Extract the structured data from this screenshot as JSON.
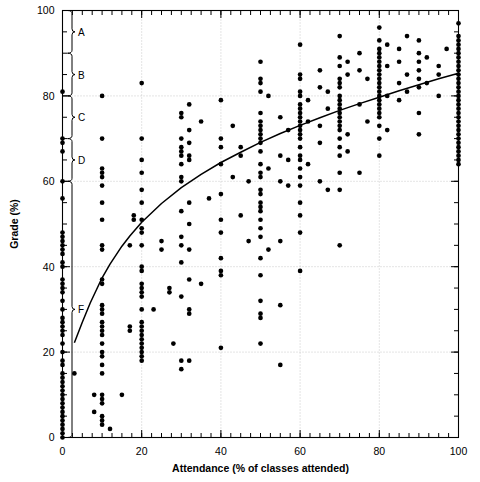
{
  "chart_data": {
    "type": "scatter",
    "title": "",
    "xlabel": "Attendance (% of classes attended)",
    "ylabel": "Grade (%)",
    "xlim": [
      0,
      100
    ],
    "ylim": [
      0,
      100
    ],
    "xticks": [
      0,
      20,
      40,
      60,
      80,
      100
    ],
    "yticks": [
      0,
      20,
      40,
      60,
      80,
      100
    ],
    "xtick_labels": [
      "0",
      "20",
      "40",
      "60",
      "80",
      "100"
    ],
    "ytick_labels": [
      "0",
      "20",
      "40",
      "60",
      "80",
      "100"
    ],
    "x_minor_tick_step": 2.5,
    "y_minor_tick_step": 5,
    "grid": "dotted-both-major",
    "legend": "none",
    "marker": "filled-circle-black",
    "grade_brackets": [
      {
        "label": "A",
        "ymin": 90,
        "ymax": 100
      },
      {
        "label": "B",
        "ymin": 80,
        "ymax": 90
      },
      {
        "label": "C",
        "ymin": 70,
        "ymax": 80
      },
      {
        "label": "D",
        "ymin": 60,
        "ymax": 70
      },
      {
        "label": "F",
        "ymin": 0,
        "ymax": 60
      }
    ],
    "fit_curve": {
      "name": "logarithmic-fit",
      "description": "monotone increasing concave curve",
      "points": [
        [
          3,
          22.2
        ],
        [
          5,
          27.0
        ],
        [
          7,
          31.5
        ],
        [
          10,
          37.4
        ],
        [
          12,
          40.6
        ],
        [
          15,
          44.8
        ],
        [
          17,
          47.2
        ],
        [
          20,
          50.4
        ],
        [
          25,
          54.8
        ],
        [
          30,
          58.5
        ],
        [
          35,
          61.6
        ],
        [
          40,
          64.4
        ],
        [
          45,
          66.8
        ],
        [
          50,
          69.1
        ],
        [
          55,
          71.2
        ],
        [
          60,
          73.1
        ],
        [
          65,
          74.9
        ],
        [
          70,
          76.6
        ],
        [
          75,
          78.2
        ],
        [
          80,
          79.7
        ],
        [
          85,
          81.2
        ],
        [
          90,
          82.6
        ],
        [
          95,
          84.0
        ],
        [
          100,
          85.3
        ]
      ]
    },
    "points": [
      [
        0,
        81
      ],
      [
        0,
        70
      ],
      [
        0,
        69
      ],
      [
        0,
        67
      ],
      [
        0,
        60
      ],
      [
        0,
        56
      ],
      [
        0,
        48
      ],
      [
        0,
        47
      ],
      [
        0,
        45
      ],
      [
        0,
        44
      ],
      [
        0,
        41
      ],
      [
        0,
        40
      ],
      [
        0,
        37
      ],
      [
        0,
        36
      ],
      [
        0,
        35
      ],
      [
        0,
        32
      ],
      [
        0,
        28
      ],
      [
        0,
        27
      ],
      [
        0,
        26
      ],
      [
        0,
        25
      ],
      [
        0,
        24
      ],
      [
        0,
        20
      ],
      [
        0,
        18
      ],
      [
        0,
        17
      ],
      [
        0,
        15
      ],
      [
        0,
        14
      ],
      [
        0,
        13
      ],
      [
        0,
        11
      ],
      [
        0,
        10
      ],
      [
        0,
        9
      ],
      [
        0,
        8
      ],
      [
        0,
        7
      ],
      [
        0,
        6
      ],
      [
        0,
        5
      ],
      [
        0,
        4
      ],
      [
        0,
        3
      ],
      [
        0,
        2
      ],
      [
        0,
        1
      ],
      [
        0,
        0
      ],
      [
        0,
        12
      ],
      [
        0,
        22
      ],
      [
        0,
        30
      ],
      [
        0,
        34
      ],
      [
        0,
        43
      ],
      [
        0,
        46
      ],
      [
        3,
        15
      ],
      [
        8,
        10
      ],
      [
        8,
        6
      ],
      [
        10,
        80
      ],
      [
        10,
        70
      ],
      [
        10,
        63
      ],
      [
        10,
        62
      ],
      [
        10,
        61
      ],
      [
        10,
        59
      ],
      [
        10,
        55
      ],
      [
        10,
        51
      ],
      [
        10,
        45
      ],
      [
        10,
        44
      ],
      [
        10,
        37
      ],
      [
        10,
        36
      ],
      [
        10,
        31
      ],
      [
        10,
        30
      ],
      [
        10,
        29
      ],
      [
        10,
        27
      ],
      [
        10,
        26
      ],
      [
        10,
        25
      ],
      [
        10,
        24
      ],
      [
        10,
        22
      ],
      [
        10,
        20
      ],
      [
        10,
        19
      ],
      [
        10,
        17
      ],
      [
        10,
        15
      ],
      [
        10,
        10
      ],
      [
        10,
        9
      ],
      [
        10,
        8
      ],
      [
        10,
        5
      ],
      [
        10,
        4
      ],
      [
        10,
        3
      ],
      [
        12,
        2
      ],
      [
        15,
        10
      ],
      [
        17,
        26
      ],
      [
        17,
        25
      ],
      [
        17,
        45
      ],
      [
        18,
        52
      ],
      [
        18,
        51
      ],
      [
        20,
        83
      ],
      [
        20,
        70
      ],
      [
        20,
        65
      ],
      [
        20,
        62
      ],
      [
        20,
        58
      ],
      [
        20,
        55
      ],
      [
        20,
        51
      ],
      [
        20,
        49
      ],
      [
        20,
        48
      ],
      [
        20,
        45
      ],
      [
        20,
        40
      ],
      [
        20,
        39
      ],
      [
        20,
        36
      ],
      [
        20,
        35
      ],
      [
        20,
        34
      ],
      [
        20,
        33
      ],
      [
        20,
        30
      ],
      [
        20,
        27
      ],
      [
        20,
        26
      ],
      [
        20,
        25
      ],
      [
        20,
        24
      ],
      [
        20,
        23
      ],
      [
        20,
        22
      ],
      [
        20,
        21
      ],
      [
        20,
        20
      ],
      [
        20,
        19
      ],
      [
        20,
        18
      ],
      [
        23,
        30
      ],
      [
        25,
        46
      ],
      [
        25,
        44
      ],
      [
        27,
        35
      ],
      [
        27,
        34
      ],
      [
        28,
        22
      ],
      [
        30,
        76
      ],
      [
        30,
        75
      ],
      [
        30,
        70
      ],
      [
        30,
        68
      ],
      [
        30,
        67
      ],
      [
        30,
        61
      ],
      [
        30,
        60
      ],
      [
        30,
        53
      ],
      [
        30,
        47
      ],
      [
        30,
        45
      ],
      [
        30,
        41
      ],
      [
        30,
        33
      ],
      [
        30,
        18
      ],
      [
        30,
        16
      ],
      [
        30,
        66
      ],
      [
        30,
        64
      ],
      [
        32,
        78
      ],
      [
        32,
        72
      ],
      [
        32,
        69
      ],
      [
        32,
        66
      ],
      [
        32,
        65
      ],
      [
        32,
        55
      ],
      [
        32,
        50
      ],
      [
        32,
        44
      ],
      [
        32,
        37
      ],
      [
        32,
        30
      ],
      [
        32,
        29
      ],
      [
        32,
        18
      ],
      [
        35,
        74
      ],
      [
        35,
        36
      ],
      [
        37,
        56
      ],
      [
        40,
        79
      ],
      [
        40,
        70
      ],
      [
        40,
        68
      ],
      [
        40,
        64
      ],
      [
        40,
        57
      ],
      [
        40,
        51
      ],
      [
        40,
        48
      ],
      [
        40,
        42
      ],
      [
        40,
        39
      ],
      [
        40,
        38
      ],
      [
        40,
        21
      ],
      [
        43,
        73
      ],
      [
        43,
        61
      ],
      [
        45,
        68
      ],
      [
        45,
        66
      ],
      [
        45,
        52
      ],
      [
        47,
        60
      ],
      [
        47,
        46
      ],
      [
        50,
        88
      ],
      [
        50,
        84
      ],
      [
        50,
        83
      ],
      [
        50,
        81
      ],
      [
        50,
        76
      ],
      [
        50,
        74
      ],
      [
        50,
        73
      ],
      [
        50,
        72
      ],
      [
        50,
        71
      ],
      [
        50,
        70
      ],
      [
        50,
        69
      ],
      [
        50,
        67
      ],
      [
        50,
        64
      ],
      [
        50,
        62
      ],
      [
        50,
        61
      ],
      [
        50,
        58
      ],
      [
        50,
        57
      ],
      [
        50,
        55
      ],
      [
        50,
        54
      ],
      [
        50,
        53
      ],
      [
        50,
        51
      ],
      [
        50,
        49
      ],
      [
        50,
        47
      ],
      [
        50,
        42
      ],
      [
        50,
        38
      ],
      [
        50,
        32
      ],
      [
        50,
        29
      ],
      [
        50,
        28
      ],
      [
        50,
        22
      ],
      [
        52,
        80
      ],
      [
        52,
        63
      ],
      [
        52,
        44
      ],
      [
        55,
        75
      ],
      [
        55,
        66
      ],
      [
        55,
        60
      ],
      [
        55,
        46
      ],
      [
        55,
        31
      ],
      [
        55,
        17
      ],
      [
        57,
        72
      ],
      [
        57,
        65
      ],
      [
        57,
        59
      ],
      [
        60,
        92
      ],
      [
        60,
        85
      ],
      [
        60,
        84
      ],
      [
        60,
        81
      ],
      [
        60,
        80
      ],
      [
        60,
        78
      ],
      [
        60,
        77
      ],
      [
        60,
        76
      ],
      [
        60,
        75
      ],
      [
        60,
        74
      ],
      [
        60,
        73
      ],
      [
        60,
        72
      ],
      [
        60,
        71
      ],
      [
        60,
        70
      ],
      [
        60,
        68
      ],
      [
        60,
        66
      ],
      [
        60,
        65
      ],
      [
        60,
        63
      ],
      [
        60,
        61
      ],
      [
        60,
        59
      ],
      [
        60,
        55
      ],
      [
        60,
        52
      ],
      [
        60,
        48
      ],
      [
        60,
        39
      ],
      [
        62,
        79
      ],
      [
        62,
        74
      ],
      [
        62,
        64
      ],
      [
        65,
        86
      ],
      [
        65,
        82
      ],
      [
        65,
        73
      ],
      [
        65,
        69
      ],
      [
        65,
        60
      ],
      [
        67,
        81
      ],
      [
        67,
        77
      ],
      [
        67,
        58
      ],
      [
        70,
        94
      ],
      [
        70,
        89
      ],
      [
        70,
        87
      ],
      [
        70,
        84
      ],
      [
        70,
        83
      ],
      [
        70,
        82
      ],
      [
        70,
        80
      ],
      [
        70,
        79
      ],
      [
        70,
        78
      ],
      [
        70,
        77
      ],
      [
        70,
        76
      ],
      [
        70,
        75
      ],
      [
        70,
        74
      ],
      [
        70,
        73
      ],
      [
        70,
        72
      ],
      [
        70,
        70
      ],
      [
        70,
        68
      ],
      [
        70,
        66
      ],
      [
        70,
        62
      ],
      [
        70,
        58
      ],
      [
        70,
        45
      ],
      [
        72,
        88
      ],
      [
        72,
        85
      ],
      [
        72,
        71
      ],
      [
        72,
        67
      ],
      [
        75,
        90
      ],
      [
        75,
        86
      ],
      [
        75,
        78
      ],
      [
        75,
        62
      ],
      [
        77,
        84
      ],
      [
        77,
        74
      ],
      [
        80,
        96
      ],
      [
        80,
        93
      ],
      [
        80,
        91
      ],
      [
        80,
        90
      ],
      [
        80,
        89
      ],
      [
        80,
        88
      ],
      [
        80,
        87
      ],
      [
        80,
        86
      ],
      [
        80,
        85
      ],
      [
        80,
        84
      ],
      [
        80,
        83
      ],
      [
        80,
        82
      ],
      [
        80,
        81
      ],
      [
        80,
        80
      ],
      [
        80,
        79
      ],
      [
        80,
        78
      ],
      [
        80,
        77
      ],
      [
        80,
        76
      ],
      [
        80,
        75
      ],
      [
        80,
        73
      ],
      [
        80,
        70
      ],
      [
        80,
        66
      ],
      [
        82,
        92
      ],
      [
        82,
        87
      ],
      [
        82,
        80
      ],
      [
        82,
        72
      ],
      [
        85,
        91
      ],
      [
        85,
        88
      ],
      [
        85,
        83
      ],
      [
        85,
        79
      ],
      [
        87,
        94
      ],
      [
        87,
        85
      ],
      [
        87,
        81
      ],
      [
        90,
        93
      ],
      [
        90,
        90
      ],
      [
        90,
        88
      ],
      [
        90,
        86
      ],
      [
        90,
        84
      ],
      [
        90,
        82
      ],
      [
        90,
        76
      ],
      [
        90,
        71
      ],
      [
        92,
        89
      ],
      [
        92,
        83
      ],
      [
        95,
        87
      ],
      [
        95,
        85
      ],
      [
        95,
        80
      ],
      [
        97,
        91
      ],
      [
        100,
        97
      ],
      [
        100,
        94
      ],
      [
        100,
        93
      ],
      [
        100,
        92
      ],
      [
        100,
        91
      ],
      [
        100,
        90
      ],
      [
        100,
        89
      ],
      [
        100,
        88
      ],
      [
        100,
        87
      ],
      [
        100,
        86
      ],
      [
        100,
        85
      ],
      [
        100,
        84
      ],
      [
        100,
        83
      ],
      [
        100,
        82
      ],
      [
        100,
        81
      ],
      [
        100,
        80
      ],
      [
        100,
        79
      ],
      [
        100,
        78
      ],
      [
        100,
        77
      ],
      [
        100,
        76
      ],
      [
        100,
        75
      ],
      [
        100,
        74
      ],
      [
        100,
        73
      ],
      [
        100,
        72
      ],
      [
        100,
        71
      ],
      [
        100,
        70
      ],
      [
        100,
        69
      ],
      [
        100,
        68
      ],
      [
        100,
        67
      ],
      [
        100,
        66
      ],
      [
        100,
        65
      ],
      [
        100,
        64
      ]
    ]
  },
  "style": {
    "point_color": "#000000",
    "curve_color": "#000000",
    "axis_color": "#000000",
    "grid_color": "#bdbdbd",
    "background": "#ffffff"
  }
}
